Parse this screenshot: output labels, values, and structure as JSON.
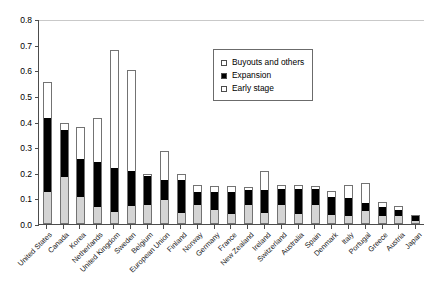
{
  "chart_data": {
    "type": "bar",
    "subtype": "stacked-vertical",
    "title": "",
    "xlabel": "",
    "ylabel": "",
    "ylim": [
      0,
      0.8
    ],
    "ytick_values": [
      0,
      0.1,
      0.2,
      0.3,
      0.4,
      0.5,
      0.6,
      0.7,
      0.8
    ],
    "ytick_labels": [
      "0.0",
      "0.1",
      "0.2",
      "0.3",
      "0.4",
      "0.5",
      "0.6",
      "0.7",
      "0.8"
    ],
    "grid": "horizontal-top-only",
    "legend_position": "upper-center-right",
    "categories": [
      "United States",
      "Canada",
      "Korea",
      "Netherlands",
      "United Kingdom",
      "Sweden",
      "Belgium",
      "European Union",
      "Finland",
      "Norway",
      "Germany",
      "France",
      "New Zealand",
      "Ireland",
      "Switzerland",
      "Australia",
      "Spain",
      "Denmark",
      "Italy",
      "Portugal",
      "Greece",
      "Austria",
      "Japan"
    ],
    "series": [
      {
        "name": "Early stage",
        "color": "#d4d4d4",
        "values": [
          0.125,
          0.185,
          0.105,
          0.068,
          0.048,
          0.072,
          0.073,
          0.095,
          0.043,
          0.075,
          0.056,
          0.038,
          0.073,
          0.044,
          0.073,
          0.04,
          0.075,
          0.035,
          0.03,
          0.051,
          0.031,
          0.03,
          0.012
        ]
      },
      {
        "name": "Expansion",
        "color": "#000000",
        "values": [
          0.29,
          0.18,
          0.147,
          0.173,
          0.172,
          0.135,
          0.113,
          0.078,
          0.128,
          0.05,
          0.069,
          0.088,
          0.06,
          0.089,
          0.063,
          0.095,
          0.06,
          0.072,
          0.073,
          0.03,
          0.036,
          0.023,
          0.018
        ]
      },
      {
        "name": "Buyouts and others",
        "color": "#ffffff",
        "values": [
          0.14,
          0.03,
          0.128,
          0.174,
          0.46,
          0.393,
          0.01,
          0.112,
          0.024,
          0.026,
          0.025,
          0.021,
          0.012,
          0.075,
          0.018,
          0.017,
          0.015,
          0.021,
          0.051,
          0.079,
          0.018,
          0.016,
          0.005
        ]
      }
    ],
    "totals": [
      0.555,
      0.395,
      0.38,
      0.415,
      0.68,
      0.6,
      0.196,
      0.285,
      0.195,
      0.151,
      0.15,
      0.147,
      0.145,
      0.208,
      0.154,
      0.152,
      0.15,
      0.128,
      0.154,
      0.16,
      0.085,
      0.069,
      0.035
    ]
  },
  "legend": {
    "items": [
      {
        "label": "Buyouts and others",
        "swatch": "white"
      },
      {
        "label": "Expansion",
        "swatch": "black"
      },
      {
        "label": "Early stage",
        "swatch": "gray"
      }
    ]
  }
}
